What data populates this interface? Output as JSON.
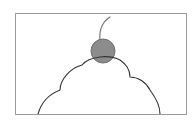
{
  "illustration": {
    "subject": "cherry on top of whipped cream",
    "frame": {
      "x": 15,
      "y": 13,
      "width": 171,
      "height": 101,
      "stroke": "#9a9a9a"
    },
    "cherry": {
      "cx": 103,
      "cy": 51,
      "r": 12,
      "fill": "#8c8c8c",
      "stroke": "#6e6e6e"
    },
    "stem": {
      "stroke": "#7a7a7a"
    },
    "cream": {
      "stroke": "#333333",
      "fill": "#ffffff"
    }
  }
}
